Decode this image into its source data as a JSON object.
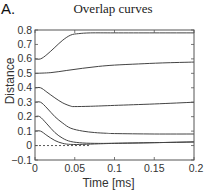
{
  "panel_label": "A.",
  "chart_data": {
    "type": "line",
    "title": "Overlap curves",
    "xlabel": "Time [ms]",
    "ylabel": "Distance",
    "xlim": [
      0,
      0.2
    ],
    "ylim": [
      -0.1,
      0.8
    ],
    "xticks": [
      0,
      0.05,
      0.1,
      0.15,
      0.2
    ],
    "xtick_labels": [
      "0",
      "0.05",
      "0.1",
      "0.15",
      "0.2"
    ],
    "yticks": [
      -0.1,
      0,
      0.1,
      0.2,
      0.3,
      0.4,
      0.5,
      0.6,
      0.7,
      0.8
    ],
    "ytick_labels": [
      "−0.1",
      "0",
      "0.1",
      "0.2",
      "0.3",
      "0.4",
      "0.5",
      "0.6",
      "0.7",
      "0.8"
    ],
    "grid": false,
    "legend": null,
    "reference_line": {
      "y": 0,
      "style": "dashed",
      "x_end": 0.07
    },
    "series": [
      {
        "name": "curve-0.6",
        "x": [
          0,
          0.007,
          0.015,
          0.025,
          0.035,
          0.045,
          0.055,
          0.07,
          0.1,
          0.15,
          0.2
        ],
        "y": [
          0.6,
          0.6,
          0.63,
          0.68,
          0.73,
          0.765,
          0.775,
          0.78,
          0.78,
          0.78,
          0.78
        ]
      },
      {
        "name": "curve-0.5",
        "x": [
          0,
          0.02,
          0.04,
          0.06,
          0.08,
          0.1,
          0.13,
          0.16,
          0.2
        ],
        "y": [
          0.5,
          0.505,
          0.52,
          0.535,
          0.548,
          0.557,
          0.565,
          0.572,
          0.578
        ]
      },
      {
        "name": "curve-0.4",
        "x": [
          0,
          0.007,
          0.015,
          0.025,
          0.035,
          0.045,
          0.05,
          0.07,
          0.1,
          0.15,
          0.2
        ],
        "y": [
          0.4,
          0.4,
          0.37,
          0.33,
          0.295,
          0.273,
          0.27,
          0.272,
          0.278,
          0.288,
          0.3
        ]
      },
      {
        "name": "curve-0.3",
        "x": [
          0,
          0.007,
          0.015,
          0.025,
          0.035,
          0.045,
          0.06,
          0.075,
          0.09,
          0.1,
          0.15,
          0.2
        ],
        "y": [
          0.3,
          0.3,
          0.26,
          0.2,
          0.155,
          0.12,
          0.1,
          0.09,
          0.085,
          0.083,
          0.08,
          0.08
        ]
      },
      {
        "name": "curve-0.2",
        "x": [
          0,
          0.006,
          0.015,
          0.025,
          0.035,
          0.045,
          0.06,
          0.08,
          0.1,
          0.15,
          0.2
        ],
        "y": [
          0.2,
          0.2,
          0.15,
          0.09,
          0.05,
          0.028,
          0.018,
          0.015,
          0.016,
          0.02,
          0.025
        ]
      },
      {
        "name": "curve-0.1",
        "x": [
          0,
          0.007,
          0.015,
          0.025,
          0.035,
          0.045,
          0.06,
          0.08,
          0.1,
          0.15,
          0.2
        ],
        "y": [
          0.1,
          0.1,
          0.07,
          0.035,
          0.015,
          0.008,
          0.008,
          0.012,
          0.015,
          0.02,
          0.025
        ]
      }
    ]
  },
  "colors": {
    "line": "#444444",
    "axis": "#555555",
    "text": "#222222"
  }
}
